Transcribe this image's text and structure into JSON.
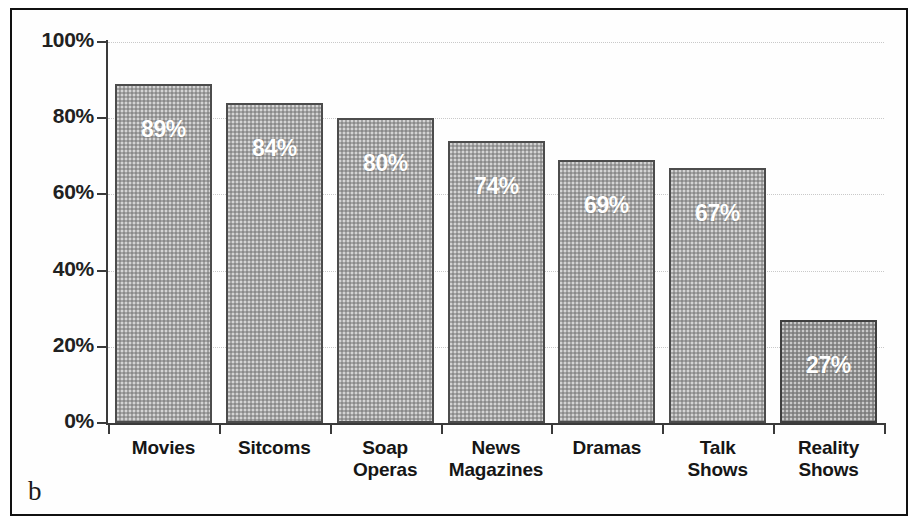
{
  "figure": {
    "panel_letter": "b",
    "background_color": "#ffffff",
    "border_color": "#111111"
  },
  "chart_data": {
    "type": "bar",
    "title": "",
    "subtitle": "",
    "xlabel": "",
    "ylabel": "",
    "categories": [
      "Movies",
      "Sitcoms",
      "Soap Operas",
      "News Magazines",
      "Dramas",
      "Talk Shows",
      "Reality Shows"
    ],
    "category_lines": [
      [
        "Movies"
      ],
      [
        "Sitcoms"
      ],
      [
        "Soap",
        "Operas"
      ],
      [
        "News",
        "Magazines"
      ],
      [
        "Dramas"
      ],
      [
        "Talk",
        "Shows"
      ],
      [
        "Reality",
        "Shows"
      ]
    ],
    "values": [
      89,
      84,
      80,
      74,
      69,
      67,
      27
    ],
    "data_labels": [
      "89%",
      "84%",
      "80%",
      "74%",
      "69%",
      "67%",
      "27%"
    ],
    "ylim": [
      0,
      100
    ],
    "yticks": [
      0,
      20,
      40,
      60,
      80,
      100
    ],
    "ytick_labels": [
      "0%",
      "20%",
      "40%",
      "60%",
      "80%",
      "100%"
    ],
    "grid": true,
    "grid_style": "dotted",
    "grid_color": "#c9c9c9",
    "legend": null,
    "legend_position": "none",
    "bar_fill_color": "#a3a3a3",
    "bar_fill_color_last": "#8f8f8f",
    "bar_border_color": "#4c4c4c",
    "data_label_color": "#ffffff",
    "axis_color": "#3a3a3a"
  }
}
